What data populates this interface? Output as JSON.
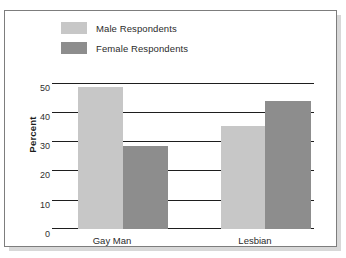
{
  "figure": {
    "background": "#ffffff",
    "border_color": "#7d7d7d"
  },
  "legend": {
    "items": [
      {
        "label": "Male Respondents",
        "color": "#c7c7c7",
        "key": "male"
      },
      {
        "label": "Female Respondents",
        "color": "#8d8d8d",
        "key": "female"
      }
    ]
  },
  "axis": {
    "y_title": "Percent",
    "tick_labels": [
      "50",
      "40",
      "30",
      "20",
      "10",
      "0"
    ],
    "category_labels": [
      "Gay Man",
      "Lesbian"
    ]
  },
  "chart_data": {
    "type": "bar",
    "title": "",
    "xlabel": "",
    "ylabel": "Percent",
    "categories": [
      "Gay Man",
      "Lesbian"
    ],
    "series": [
      {
        "name": "Male Respondents",
        "color": "#c7c7c7",
        "values": [
          49,
          35.5
        ]
      },
      {
        "name": "Female Respondents",
        "color": "#8d8d8d",
        "values": [
          28.5,
          44
        ]
      }
    ],
    "ylim": [
      0,
      50
    ],
    "yticks": [
      0,
      10,
      20,
      30,
      40,
      50
    ],
    "grid": true,
    "legend_position": "top-left"
  }
}
